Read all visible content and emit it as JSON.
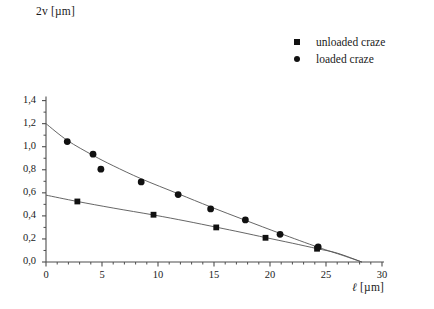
{
  "chart_data": {
    "type": "scatter",
    "title": "",
    "xlabel": "ℓ [µm]",
    "ylabel": "2v [µm]",
    "xlim": [
      0,
      30
    ],
    "ylim": [
      0.0,
      1.4
    ],
    "grid": false,
    "legend_position": "top-right",
    "x_ticks": [
      0,
      5,
      10,
      15,
      20,
      25,
      30
    ],
    "x_tick_labels": [
      "0",
      "5",
      "10",
      "15",
      "20",
      "25",
      "30"
    ],
    "x_minor_tick_step": 1,
    "y_ticks": [
      0.0,
      0.2,
      0.4,
      0.6,
      0.8,
      1.0,
      1.2,
      1.4
    ],
    "y_tick_labels": [
      "0,0",
      "0,2",
      "0,4",
      "0,6",
      "0,8",
      "1,0",
      "1,2",
      "1,4"
    ],
    "y_minor_tick_step": 0.1,
    "decimal_separator": ",",
    "series": [
      {
        "name": "unloaded craze",
        "marker": "square",
        "color": "#111111",
        "points": [
          {
            "x": 2.8,
            "y": 0.525
          },
          {
            "x": 9.6,
            "y": 0.41
          },
          {
            "x": 15.2,
            "y": 0.3
          },
          {
            "x": 19.6,
            "y": 0.21
          },
          {
            "x": 24.2,
            "y": 0.115
          }
        ],
        "fit_curve": {
          "description": "smooth decreasing curve from y-intercept to x-intercept",
          "y_intercept": 0.58,
          "x_intercept": 28.2,
          "points": [
            {
              "x": 0.0,
              "y": 0.58
            },
            {
              "x": 2.8,
              "y": 0.525
            },
            {
              "x": 6.0,
              "y": 0.468
            },
            {
              "x": 9.6,
              "y": 0.408
            },
            {
              "x": 12.5,
              "y": 0.355
            },
            {
              "x": 15.2,
              "y": 0.302
            },
            {
              "x": 17.5,
              "y": 0.256
            },
            {
              "x": 19.6,
              "y": 0.212
            },
            {
              "x": 22.0,
              "y": 0.163
            },
            {
              "x": 24.2,
              "y": 0.116
            },
            {
              "x": 26.0,
              "y": 0.077
            },
            {
              "x": 28.2,
              "y": 0.0
            }
          ]
        }
      },
      {
        "name": "loaded craze",
        "marker": "circle",
        "color": "#111111",
        "points": [
          {
            "x": 1.9,
            "y": 1.045
          },
          {
            "x": 4.2,
            "y": 0.935
          },
          {
            "x": 4.9,
            "y": 0.805
          },
          {
            "x": 8.5,
            "y": 0.695
          },
          {
            "x": 11.8,
            "y": 0.585
          },
          {
            "x": 14.7,
            "y": 0.46
          },
          {
            "x": 17.8,
            "y": 0.365
          },
          {
            "x": 20.9,
            "y": 0.24
          },
          {
            "x": 24.3,
            "y": 0.13
          }
        ],
        "fit_curve": {
          "description": "smooth decreasing curve from y-intercept to x-intercept",
          "y_intercept": 1.2,
          "x_intercept": 28.2,
          "points": [
            {
              "x": 0.0,
              "y": 1.2
            },
            {
              "x": 1.9,
              "y": 1.055
            },
            {
              "x": 4.2,
              "y": 0.925
            },
            {
              "x": 6.0,
              "y": 0.835
            },
            {
              "x": 8.5,
              "y": 0.722
            },
            {
              "x": 11.8,
              "y": 0.592
            },
            {
              "x": 14.7,
              "y": 0.478
            },
            {
              "x": 17.8,
              "y": 0.362
            },
            {
              "x": 20.9,
              "y": 0.248
            },
            {
              "x": 24.3,
              "y": 0.128
            },
            {
              "x": 26.5,
              "y": 0.057
            },
            {
              "x": 28.2,
              "y": 0.0
            }
          ]
        }
      }
    ]
  },
  "axes": {
    "y_title": "2v [µm]",
    "x_title_symbol": "ℓ",
    "x_title_unit": "[µm]"
  },
  "legend": {
    "entries": [
      {
        "label": "unloaded craze",
        "marker": "square-marker"
      },
      {
        "label": "loaded craze",
        "marker": "circle-marker"
      }
    ]
  }
}
